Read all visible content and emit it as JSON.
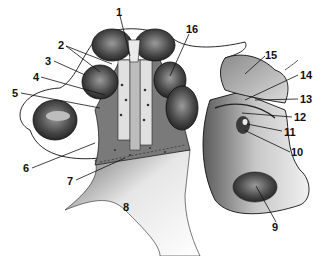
{
  "figure": {
    "colors": {
      "ink": "#111111",
      "shade_dark": "#3a3a3a",
      "shade_mid": "#8a8a8a",
      "shade_light": "#d0d0d0",
      "background": "#ffffff"
    },
    "labels": [
      {
        "id": "1",
        "text": "1",
        "x": 116,
        "y": 7
      },
      {
        "id": "2",
        "text": "2",
        "x": 58,
        "y": 43
      },
      {
        "id": "3",
        "text": "3",
        "x": 45,
        "y": 57
      },
      {
        "id": "4",
        "text": "4",
        "x": 33,
        "y": 73
      },
      {
        "id": "5",
        "text": "5",
        "x": 12,
        "y": 89
      },
      {
        "id": "6",
        "text": "6",
        "x": 23,
        "y": 164
      },
      {
        "id": "7",
        "text": "7",
        "x": 67,
        "y": 176
      },
      {
        "id": "8",
        "text": "8",
        "x": 123,
        "y": 203
      },
      {
        "id": "9",
        "text": "9",
        "x": 272,
        "y": 223
      },
      {
        "id": "10",
        "text": "10",
        "x": 291,
        "y": 148
      },
      {
        "id": "11",
        "text": "11",
        "x": 284,
        "y": 127
      },
      {
        "id": "12",
        "text": "12",
        "x": 294,
        "y": 113
      },
      {
        "id": "13",
        "text": "13",
        "x": 300,
        "y": 95
      },
      {
        "id": "14",
        "text": "14",
        "x": 300,
        "y": 71
      },
      {
        "id": "15",
        "text": "15",
        "x": 265,
        "y": 51
      },
      {
        "id": "16",
        "text": "16",
        "x": 186,
        "y": 25
      }
    ]
  }
}
